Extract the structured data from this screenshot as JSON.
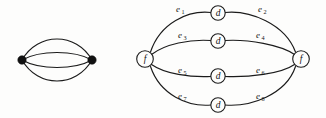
{
  "figure": {
    "background_color": "#fdfdfc",
    "ink_color": "#1b1b1b",
    "left_graph": {
      "name": "multigraph-two-vertices-four-parallel-edges",
      "vertex_style": "filled-dot",
      "vertex_count": 2,
      "edge_count": 4,
      "vertices": [
        {
          "id": "v-left",
          "label": "",
          "cx": 22,
          "cy": 60
        },
        {
          "id": "v-right",
          "label": "",
          "cx": 92,
          "cy": 60
        }
      ],
      "edges": [
        {
          "id": "edge-1",
          "label": "",
          "bow": -21
        },
        {
          "id": "edge-2",
          "label": "",
          "bow": -7
        },
        {
          "id": "edge-3",
          "label": "",
          "bow": 7
        },
        {
          "id": "edge-4",
          "label": "",
          "bow": 21
        }
      ]
    },
    "right_graph": {
      "name": "subdivided-multigraph",
      "end_vertices": [
        {
          "id": "node-f-left",
          "label": "f",
          "cx": 145,
          "cy": 59
        },
        {
          "id": "node-f-right",
          "label": "f",
          "cx": 301,
          "cy": 59
        }
      ],
      "middle_vertices": [
        {
          "id": "node-d-1",
          "label": "d",
          "cx": 218,
          "cy": 13
        },
        {
          "id": "node-d-2",
          "label": "d",
          "cx": 218,
          "cy": 41
        },
        {
          "id": "node-d-3",
          "label": "d",
          "cx": 218,
          "cy": 76
        },
        {
          "id": "node-d-4",
          "label": "d",
          "cx": 218,
          "cy": 105
        }
      ],
      "edge_labels": [
        {
          "id": "label-e1",
          "base": "e",
          "sub": "1",
          "x": 178,
          "y": 12
        },
        {
          "id": "label-e2",
          "base": "e",
          "sub": "2",
          "x": 260,
          "y": 12
        },
        {
          "id": "label-e3",
          "base": "e",
          "sub": "3",
          "x": 180,
          "y": 38
        },
        {
          "id": "label-e4",
          "base": "e",
          "sub": "4",
          "x": 258,
          "y": 38
        },
        {
          "id": "label-e5",
          "base": "e",
          "sub": "5",
          "x": 180,
          "y": 73
        },
        {
          "id": "label-e6",
          "base": "e",
          "sub": "6",
          "x": 258,
          "y": 73
        },
        {
          "id": "label-e7",
          "base": "e",
          "sub": "7",
          "x": 180,
          "y": 99
        },
        {
          "id": "label-e8",
          "base": "e",
          "sub": "8",
          "x": 258,
          "y": 99
        }
      ]
    }
  }
}
